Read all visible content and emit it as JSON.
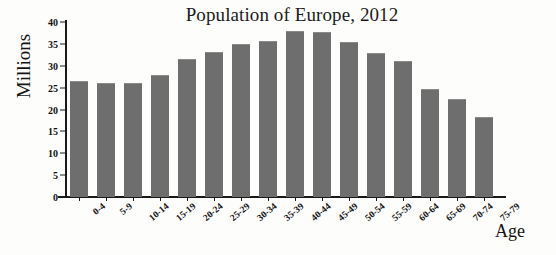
{
  "chart_data": {
    "type": "bar",
    "title": "Population of Europe, 2012",
    "xlabel": "Age",
    "ylabel": "Millions",
    "categories": [
      "0-4",
      "5-9",
      "10-14",
      "15-19",
      "20-24",
      "25-29",
      "30-34",
      "35-39",
      "40-44",
      "45-49",
      "50-54",
      "55-59",
      "60-64",
      "65-69",
      "70-74",
      "75-79"
    ],
    "values": [
      26.5,
      26.0,
      26.0,
      27.8,
      31.6,
      33.2,
      35.0,
      35.7,
      38.0,
      37.7,
      35.4,
      32.9,
      31.0,
      24.8,
      22.5,
      18.3
    ],
    "ylim": [
      0,
      40
    ],
    "yticks": [
      0,
      5,
      10,
      15,
      20,
      25,
      30,
      35,
      40
    ],
    "ytick_labels": [
      "0",
      "5",
      "10",
      "15",
      "20",
      "25",
      "30",
      "35",
      "40"
    ],
    "grid": false,
    "legend": null,
    "bar_color": "#6e6e6e",
    "axis_color": "#1a1a1a",
    "background_color": "#fdfdfc"
  }
}
